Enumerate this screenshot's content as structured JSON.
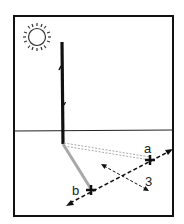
{
  "diagram": {
    "labels": {
      "shadow_tip_first": "a",
      "shadow_tip_second": "b",
      "step_number": "3"
    },
    "icons": {
      "sun": "sun-icon",
      "mark_a": "cross-mark-icon",
      "mark_b": "cross-mark-icon"
    },
    "colors": {
      "ink": "#111111",
      "shadow_b": "#a8a8a8",
      "shadow_a": "#b0b0b0",
      "background": "#ffffff"
    }
  }
}
